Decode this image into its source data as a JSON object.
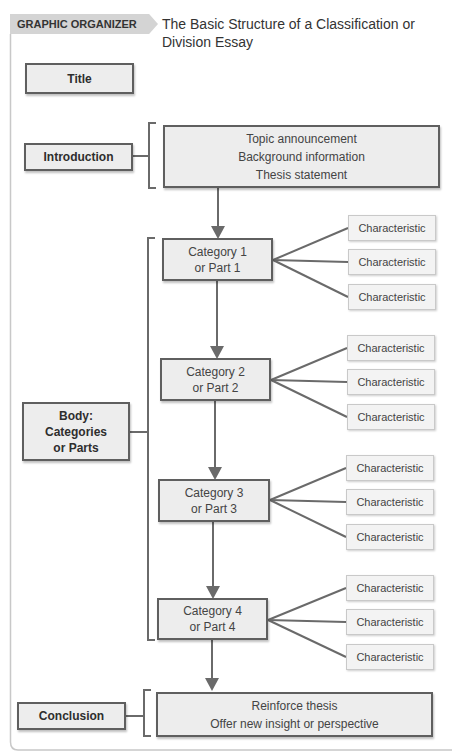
{
  "header": {
    "label": "GRAPHIC ORGANIZER 16.1",
    "title": "The Basic Structure of a Classification or Division Essay"
  },
  "sections": {
    "title": {
      "label": "Title"
    },
    "introduction": {
      "label": "Introduction",
      "content": [
        "Topic announcement",
        "Background information",
        "Thesis statement"
      ]
    },
    "body": {
      "label_lines": [
        "Body:",
        "Categories",
        "or Parts"
      ],
      "categories": [
        {
          "line1": "Category 1",
          "line2": "or Part 1",
          "characteristics": [
            "Characteristic",
            "Characteristic",
            "Characteristic"
          ]
        },
        {
          "line1": "Category 2",
          "line2": "or Part 2",
          "characteristics": [
            "Characteristic",
            "Characteristic",
            "Characteristic"
          ]
        },
        {
          "line1": "Category 3",
          "line2": "or Part 3",
          "characteristics": [
            "Characteristic",
            "Characteristic",
            "Characteristic"
          ]
        },
        {
          "line1": "Category 4",
          "line2": "or Part 4",
          "characteristics": [
            "Characteristic",
            "Characteristic",
            "Characteristic"
          ]
        }
      ]
    },
    "conclusion": {
      "label": "Conclusion",
      "content": [
        "Reinforce thesis",
        "Offer new insight or perspective"
      ]
    }
  },
  "colors": {
    "box_fill": "#ededed",
    "box_border": "#5f5f5f",
    "line": "#6a6a6a",
    "header_tab": "#d4d4d4",
    "frame": "#c8c8c8"
  }
}
